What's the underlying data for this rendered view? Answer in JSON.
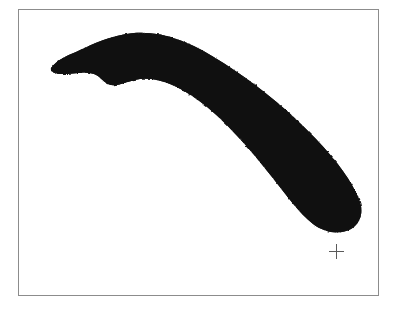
{
  "figure": {
    "caption": "Black silhouette of a banana",
    "subject_label": "banana-silhouette",
    "background_color": "#ffffff",
    "frame": {
      "label": "figure-border",
      "color": "#8c8c8c",
      "line_width_px": 1,
      "x": 18,
      "y": 9,
      "width": 361,
      "height": 287
    },
    "silhouette": {
      "label": "banana",
      "fill_color": "#151515",
      "texture": "grainy",
      "orientation": "stem upper-left, tip lower-right",
      "bounding_box": {
        "x": 50,
        "y": 33,
        "width": 312,
        "height": 200
      },
      "stem_tip_point": {
        "x": 51,
        "y": 68
      },
      "blossom_end_point": {
        "x": 340,
        "y": 230
      }
    },
    "crosshair": {
      "label": "registration-mark",
      "glyph": "+",
      "color": "#5a5a5a",
      "x": 336,
      "y": 251,
      "size_px": 15
    }
  }
}
